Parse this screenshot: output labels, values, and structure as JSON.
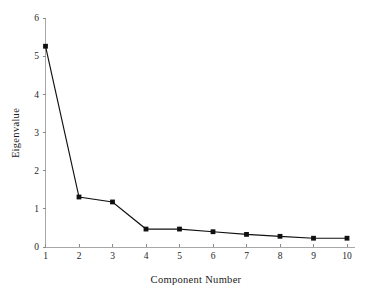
{
  "chart_data": {
    "type": "line",
    "title": "",
    "xlabel": "Component Number",
    "ylabel": "Eigenvalue",
    "x": [
      1,
      2,
      3,
      4,
      5,
      6,
      7,
      8,
      9,
      10
    ],
    "categories": [
      "1",
      "2",
      "3",
      "4",
      "5",
      "6",
      "7",
      "8",
      "9",
      "10"
    ],
    "values": [
      5.26,
      1.31,
      1.18,
      0.47,
      0.47,
      0.4,
      0.33,
      0.28,
      0.23,
      0.23
    ],
    "series": [
      {
        "name": "Eigenvalue",
        "values": [
          5.26,
          1.31,
          1.18,
          0.47,
          0.47,
          0.4,
          0.33,
          0.28,
          0.23,
          0.23
        ]
      }
    ],
    "xlim": [
      1,
      10
    ],
    "ylim": [
      0,
      6
    ],
    "xticks": [
      "1",
      "2",
      "3",
      "4",
      "5",
      "6",
      "7",
      "8",
      "9",
      "10"
    ],
    "yticks": [
      "0",
      "1",
      "2",
      "3",
      "4",
      "5",
      "6"
    ],
    "grid": false,
    "legend": false,
    "marker": "square",
    "line_color": "#101010",
    "marker_color": "#101010",
    "axis_color": "#a8a8a8",
    "background_color": "#ffffff"
  }
}
